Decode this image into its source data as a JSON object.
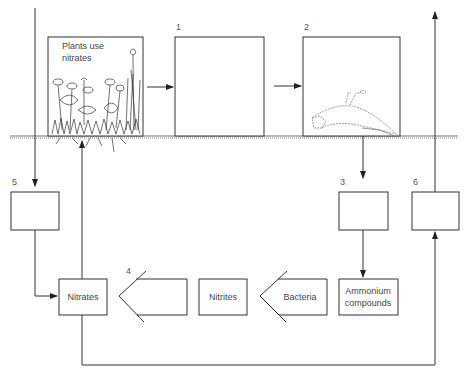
{
  "diagram": {
    "type": "nitrogen-cycle",
    "boxes": {
      "plants": {
        "label_line1": "Plants use",
        "label_line2": "nitrates"
      },
      "box1": {
        "number": "1",
        "label": ""
      },
      "box2": {
        "number": "2",
        "label": ""
      },
      "box3": {
        "number": "3",
        "label": ""
      },
      "box5": {
        "number": "5",
        "label": ""
      },
      "box6": {
        "number": "6",
        "label": ""
      },
      "nitrates": {
        "label": "Nitrates"
      },
      "step4": {
        "number": "4",
        "label": ""
      },
      "nitrites": {
        "label": "Nitrites"
      },
      "bacteria": {
        "label": "Bacteria"
      },
      "ammonium": {
        "label_line1": "Ammonium",
        "label_line2": "compounds"
      }
    },
    "flows": [
      "input-down -> box5",
      "plants -> box1",
      "box1 -> box2",
      "box2 -> box3",
      "box3 -> ammonium",
      "ammonium -> bacteria -> nitrites -> step4 -> nitrates",
      "box5 -> nitrates",
      "nitrates -> plants",
      "nitrates -> box6",
      "box6 -> output-up"
    ],
    "illustrations": [
      "plants-illustration",
      "dead-animal-illustration",
      "soil-ground-line"
    ]
  }
}
